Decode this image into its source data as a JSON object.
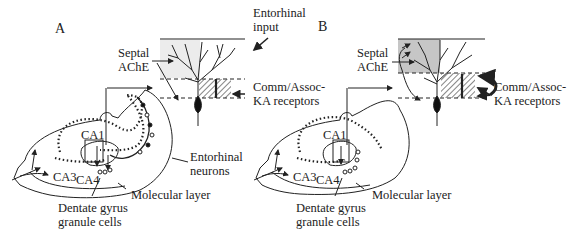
{
  "figure": {
    "panel_a": {
      "letter": "A",
      "labels": {
        "entorhinal_input_1": "Entorhinal",
        "entorhinal_input_2": "input",
        "septal_1": "Septal",
        "septal_2": "AChE",
        "comm_1": "Comm/Assoc-",
        "comm_2": "KA receptors",
        "ca1": "CA1",
        "ca3": "CA3",
        "ca4": "CA4",
        "ento_neurons_1": "Entorhinal",
        "ento_neurons_2": "neurons",
        "molecular": "Molecular layer",
        "dentate_1": "Dentate gyrus",
        "dentate_2": "granule cells"
      }
    },
    "panel_b": {
      "letter": "B",
      "labels": {
        "septal_1": "Septal",
        "septal_2": "AChE",
        "comm_1": "Comm/Assoc-",
        "comm_2": "KA receptors",
        "ca1": "CA1",
        "ca3": "CA3",
        "ca4": "CA4",
        "molecular": "Molecular layer",
        "dentate_1": "Dentate gyrus",
        "dentate_2": "granule cells"
      }
    },
    "colors": {
      "ink": "#222222",
      "shade_light": "#e6e6e6",
      "shade_dark": "#c4c4c4"
    }
  }
}
